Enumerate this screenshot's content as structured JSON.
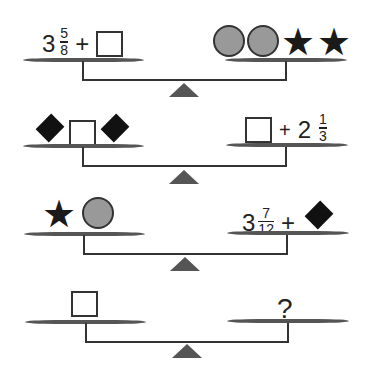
{
  "puzzle": {
    "scales": [
      {
        "left": {
          "items": [
            {
              "type": "mixed",
              "whole": "3",
              "num": "5",
              "den": "8"
            },
            {
              "type": "op",
              "text": "+"
            },
            {
              "type": "box"
            }
          ]
        },
        "right": {
          "items": [
            {
              "type": "circle"
            },
            {
              "type": "circle"
            },
            {
              "type": "star"
            },
            {
              "type": "star"
            }
          ]
        }
      },
      {
        "left": {
          "items": [
            {
              "type": "diamond"
            },
            {
              "type": "box"
            },
            {
              "type": "diamond"
            }
          ]
        },
        "right": {
          "items": [
            {
              "type": "box"
            },
            {
              "type": "op",
              "text": "+"
            },
            {
              "type": "mixed",
              "whole": "2",
              "num": "1",
              "den": "3"
            }
          ]
        }
      },
      {
        "left": {
          "items": [
            {
              "type": "star"
            },
            {
              "type": "circle"
            }
          ]
        },
        "right": {
          "items": [
            {
              "type": "mixed",
              "whole": "3",
              "num": "7",
              "den": "12"
            },
            {
              "type": "op",
              "text": "+"
            },
            {
              "type": "diamond"
            }
          ]
        }
      },
      {
        "left": {
          "items": [
            {
              "type": "box"
            }
          ]
        },
        "right": {
          "items": [
            {
              "type": "question",
              "text": "?"
            }
          ]
        }
      }
    ],
    "text": {
      "s1_whole": "3",
      "s1_num": "5",
      "s1_den": "8",
      "plus": "+",
      "s2_whole": "2",
      "s2_num": "1",
      "s2_den": "3",
      "s3_whole": "3",
      "s3_num": "7",
      "s3_den": "12",
      "question": "?"
    },
    "colors": {
      "pan": "#555555",
      "circle": "#999999",
      "shape": "#111111"
    }
  }
}
